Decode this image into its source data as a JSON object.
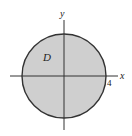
{
  "diagram": {
    "type": "region-in-plane",
    "axes": {
      "x_label": "x",
      "y_label": "y"
    },
    "region": {
      "label": "D",
      "shape": "circle",
      "center": [
        0,
        0
      ],
      "radius": 4,
      "fill_color": "#cfcfcf",
      "stroke_color": "#333333"
    },
    "tick_labels": [
      {
        "value": "4",
        "axis": "x",
        "position": 4
      }
    ]
  }
}
